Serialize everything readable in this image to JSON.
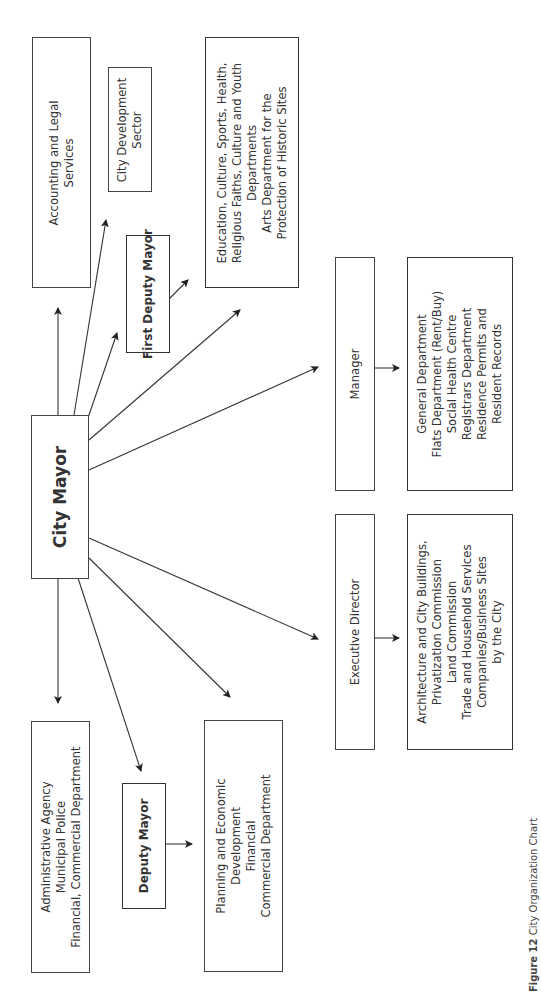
{
  "diagram": {
    "type": "organization-chart",
    "orientation": "rotated-90-ccw",
    "root": {
      "id": "city-mayor",
      "label": "City Mayor"
    },
    "nodes": [
      {
        "id": "accounting",
        "label": "Accounting and Legal\nServices"
      },
      {
        "id": "city-development",
        "label": "City Development\nSector"
      },
      {
        "id": "first-deputy",
        "label": "First Deputy Mayor"
      },
      {
        "id": "education",
        "label": "Education, Culture, Sports, Health,\nReligious Faiths, Culture and Youth\nDepartments\nArts Department for the\nProtection of Historic Sites"
      },
      {
        "id": "manager",
        "label": "Manager"
      },
      {
        "id": "manager-depts",
        "label": "General Department\nFlats Department (Rent/Buy)\nSocial Health Centre\nRegistrars Department\nResidence Permits and\nResident Records"
      },
      {
        "id": "executive-director",
        "label": "Executive Director"
      },
      {
        "id": "exec-depts",
        "label": "Architecture and City Buildings,\nPrivatization Commission\nLand Commission\nTrade and Household Services\nCompanies/Business Sites\nby the City"
      },
      {
        "id": "administrative",
        "label": "Administrative Agency\nMunicipal Police\nFinancial, Commercial Department"
      },
      {
        "id": "deputy-mayor",
        "label": "Deputy Mayor"
      },
      {
        "id": "planning",
        "label": "Planning and Economic\nDevelopment\nFinancial\nCommercial Department"
      }
    ],
    "edges": [
      {
        "from": "city-mayor",
        "to": "accounting"
      },
      {
        "from": "city-mayor",
        "to": "city-development"
      },
      {
        "from": "city-mayor",
        "to": "first-deputy"
      },
      {
        "from": "first-deputy",
        "to": "education"
      },
      {
        "from": "city-mayor",
        "to": "education"
      },
      {
        "from": "city-mayor",
        "to": "manager"
      },
      {
        "from": "manager",
        "to": "manager-depts"
      },
      {
        "from": "city-mayor",
        "to": "executive-director"
      },
      {
        "from": "executive-director",
        "to": "exec-depts"
      },
      {
        "from": "city-mayor",
        "to": "administrative"
      },
      {
        "from": "city-mayor",
        "to": "deputy-mayor"
      },
      {
        "from": "deputy-mayor",
        "to": "planning"
      },
      {
        "from": "city-mayor",
        "to": "planning"
      }
    ]
  },
  "caption": {
    "figure_label": "Figure 12",
    "text": "City Organization Chart"
  }
}
